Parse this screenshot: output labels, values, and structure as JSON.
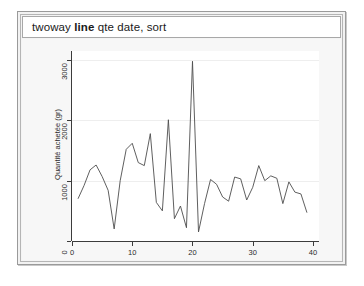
{
  "window": {
    "command_prefix": "twoway ",
    "command_bold": "line",
    "command_suffix": " qte date, sort"
  },
  "chart_data": {
    "type": "line",
    "title": "",
    "xlabel": "Semaine d'achat",
    "ylabel": "Quantité achetée (gr)",
    "xlim": [
      0,
      41
    ],
    "ylim": [
      0,
      3150
    ],
    "xticks": [
      0,
      10,
      20,
      30,
      40
    ],
    "xticklabels": [
      "0",
      "10",
      "20",
      "30",
      "40"
    ],
    "yticks": [
      0,
      1000,
      2000,
      3000
    ],
    "yticklabels": [
      "0",
      "1000",
      "2000",
      "3000"
    ],
    "grid": true,
    "grid_axis": "y",
    "legend": false,
    "line_color": "#4d4d4d",
    "series": [
      {
        "name": "qte",
        "x": [
          1,
          2,
          3,
          4,
          5,
          6,
          7,
          8,
          9,
          10,
          11,
          12,
          13,
          14,
          15,
          16,
          17,
          18,
          19,
          20,
          21,
          22,
          23,
          24,
          25,
          26,
          27,
          28,
          29,
          30,
          31,
          32,
          33,
          34,
          35,
          36,
          37,
          38,
          39
        ],
        "values": [
          700,
          920,
          1180,
          1260,
          1070,
          840,
          200,
          1000,
          1520,
          1620,
          1300,
          1250,
          1780,
          640,
          500,
          2010,
          370,
          580,
          220,
          2980,
          150,
          620,
          1020,
          940,
          730,
          660,
          1060,
          1030,
          680,
          890,
          1250,
          1000,
          1080,
          1040,
          620,
          980,
          810,
          780,
          470
        ]
      }
    ]
  }
}
